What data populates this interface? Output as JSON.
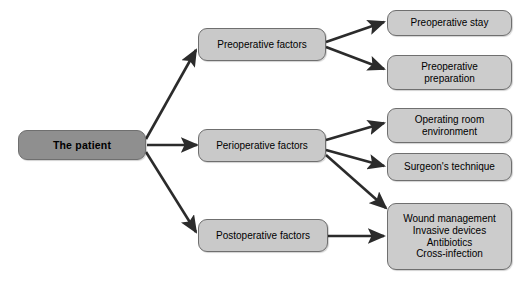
{
  "diagram": {
    "type": "tree-flowchart",
    "colors": {
      "root_fill": "#8f8f8f",
      "branch_fill": "#c9c9c9",
      "leaf_fill": "#cccccc",
      "border": "#6f6f6f",
      "arrow": "#2b2b2b",
      "background": "#ffffff",
      "text": "#000000"
    },
    "root": {
      "label": "The patient"
    },
    "branches": [
      {
        "id": "preoperative",
        "label": "Preoperative factors",
        "leaves": [
          {
            "id": "preoperative-stay",
            "label": "Preoperative stay"
          },
          {
            "id": "preoperative-preparation",
            "label": "Preoperative\npreparation"
          }
        ]
      },
      {
        "id": "perioperative",
        "label": "Perioperative factors",
        "leaves": [
          {
            "id": "operating-room-environment",
            "label": "Operating room\nenvironment"
          },
          {
            "id": "surgeons-technique",
            "label": "Surgeon's technique"
          },
          {
            "id": "postoperative-care",
            "label": "Wound management\nInvasive devices\nAntibiotics\nCross-infection"
          }
        ]
      },
      {
        "id": "postoperative",
        "label": "Postoperative factors",
        "leaves": [
          {
            "id": "postoperative-care",
            "label": "Wound management\nInvasive devices\nAntibiotics\nCross-infection"
          }
        ]
      }
    ],
    "edges": [
      {
        "id": "edge-patient-preoperative",
        "from": "The patient",
        "to": "Preoperative factors"
      },
      {
        "id": "edge-patient-perioperative",
        "from": "The patient",
        "to": "Perioperative factors"
      },
      {
        "id": "edge-patient-postoperative",
        "from": "The patient",
        "to": "Postoperative factors"
      },
      {
        "id": "edge-preoperative-stay",
        "from": "Preoperative factors",
        "to": "Preoperative stay"
      },
      {
        "id": "edge-preoperative-preparation",
        "from": "Preoperative factors",
        "to": "Preoperative preparation"
      },
      {
        "id": "edge-perioperative-environment",
        "from": "Perioperative factors",
        "to": "Operating room environment"
      },
      {
        "id": "edge-perioperative-technique",
        "from": "Perioperative factors",
        "to": "Surgeon's technique"
      },
      {
        "id": "edge-perioperative-wound",
        "from": "Perioperative factors",
        "to": "Wound management"
      },
      {
        "id": "edge-postoperative-wound",
        "from": "Postoperative factors",
        "to": "Wound management"
      }
    ]
  }
}
